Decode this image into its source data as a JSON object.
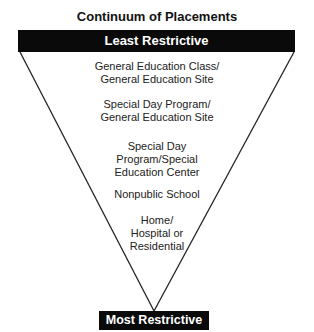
{
  "title": "Continuum of Placements",
  "top_label": "Least Restrictive",
  "bottom_label": "Most Restrictive",
  "placements": [
    {
      "lines": [
        "General Education Class/",
        "General Education Site"
      ]
    },
    {
      "lines": [
        "Special Day Program/",
        "General Education Site"
      ]
    },
    {
      "lines": [
        "Special Day",
        "Program/Special",
        "Education Center"
      ]
    },
    {
      "lines": [
        "Nonpublic School"
      ]
    },
    {
      "lines": [
        "Home/",
        "Hospital or",
        "Residential"
      ]
    }
  ]
}
